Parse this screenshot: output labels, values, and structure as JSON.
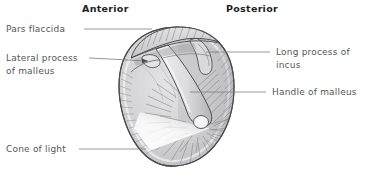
{
  "figure": {
    "background_color": "#ffffff",
    "orientation": {
      "anterior": "Anterior",
      "posterior": "Posterior"
    },
    "labels": [
      {
        "id": "pars-flaccida",
        "text": "Pars flaccida",
        "line2": "",
        "side": "left"
      },
      {
        "id": "lateral-process",
        "text": "Lateral process",
        "line2": "of malleus",
        "side": "left"
      },
      {
        "id": "cone-of-light",
        "text": "Cone of light",
        "line2": "",
        "side": "left"
      },
      {
        "id": "long-process-incus",
        "text": "Long process of",
        "line2": "incus",
        "side": "right"
      },
      {
        "id": "handle-of-malleus",
        "text": "Handle of malleus",
        "line2": "",
        "side": "right"
      }
    ],
    "colors": {
      "ink": "#55565a",
      "heading": "#1d1d1d",
      "leader": "#7c7d81",
      "outline": "#4a4a4d",
      "membrane_fill": "#c9c9cb",
      "membrane_light": "#e9e9ea",
      "cone_light": "#fbfbfb",
      "striation": "#7e7f83"
    }
  }
}
